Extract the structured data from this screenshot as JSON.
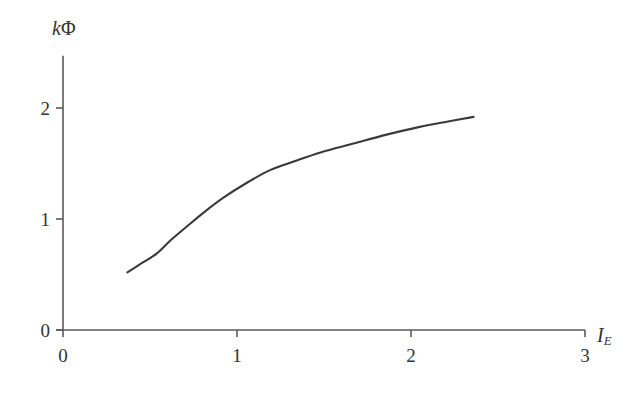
{
  "chart_data": {
    "type": "line",
    "title": "",
    "subtitle": "",
    "xlabel": "I_E",
    "ylabel": "kPhi",
    "xlabel_main": "I",
    "xlabel_sub": "E",
    "ylabel_italic": "k",
    "ylabel_upright": "Φ",
    "xlim": [
      0,
      3
    ],
    "ylim": [
      0,
      2.47
    ],
    "xticks": [
      0,
      1,
      2,
      3
    ],
    "yticks": [
      0,
      1,
      2
    ],
    "xtick_labels": [
      "0",
      "1",
      "2",
      "3"
    ],
    "ytick_labels": [
      "0",
      "1",
      "2"
    ],
    "grid": false,
    "legend": "none",
    "line_color": "#3a3a3a",
    "axis_color": "#5a5a5a",
    "background_color": "#ffffff",
    "series": [
      {
        "name": "kΦ vs I_E",
        "x": [
          0.37,
          0.45,
          0.54,
          0.62,
          0.71,
          0.81,
          0.92,
          1.05,
          1.19,
          1.33,
          1.48,
          1.67,
          1.86,
          2.05,
          2.22,
          2.36
        ],
        "y": [
          0.52,
          0.6,
          0.69,
          0.81,
          0.93,
          1.06,
          1.19,
          1.32,
          1.44,
          1.52,
          1.6,
          1.68,
          1.76,
          1.83,
          1.88,
          1.92
        ]
      }
    ],
    "annotations": []
  },
  "axis_geometry": {
    "origin_x_px": 63,
    "origin_y_px": 330,
    "px_per_x_unit": 174,
    "px_per_y_unit": 111,
    "y_axis_top_px": 55,
    "x_axis_right_px": 586,
    "tick_length_px": 7
  }
}
